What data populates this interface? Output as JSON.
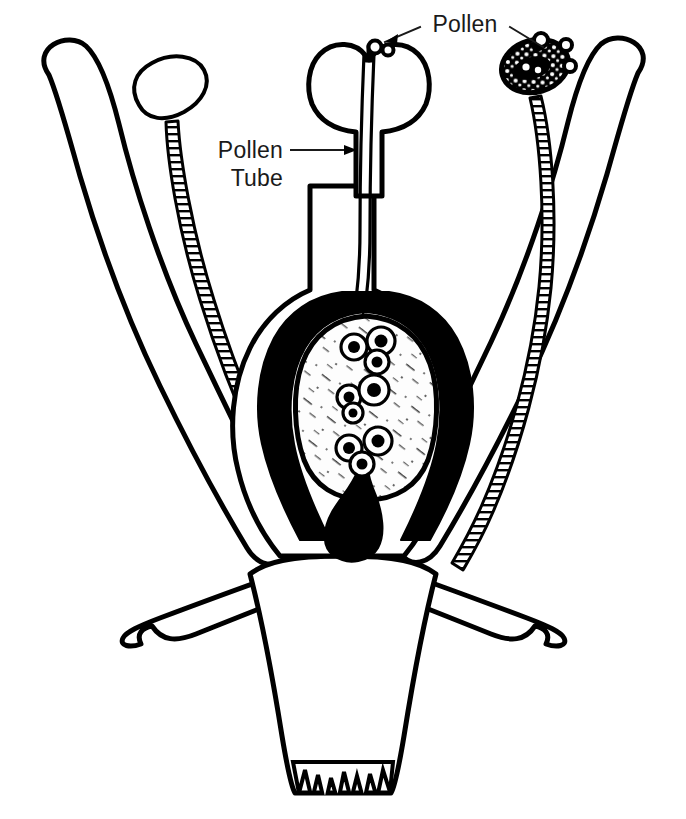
{
  "figure": {
    "background_color": "#ffffff",
    "ink_color": "#000000",
    "style": "black-and-white stippled line drawing",
    "width": 686,
    "height": 819
  },
  "labels": [
    {
      "id": "pollen",
      "text": "Pollen",
      "x": 465,
      "y": 32,
      "anchor": "middle",
      "leaders": 2
    },
    {
      "id": "pollen-tube-line1",
      "text": "Pollen",
      "x": 283,
      "y": 158,
      "anchor": "end",
      "leaders": 1
    },
    {
      "id": "pollen-tube-line2",
      "text": "Tube",
      "x": 283,
      "y": 186,
      "anchor": "end",
      "leaders": 0
    }
  ],
  "parts": [
    {
      "name": "petal-left",
      "role": "perianth lobe, stippled, curving up-left"
    },
    {
      "name": "petal-right",
      "role": "perianth lobe, stippled, curving up-right"
    },
    {
      "name": "stamen-left",
      "role": "slender filament with elongate stippled anther"
    },
    {
      "name": "stamen-right",
      "role": "slender filament with round anther shedding pollen"
    },
    {
      "name": "pistil",
      "role": "central carpel: stigma, style, ovary"
    },
    {
      "name": "stigma",
      "role": "two-lobed receptive tip with pollen grains lodged in cleft"
    },
    {
      "name": "style",
      "role": "stippled column traversed by two pollen tubes"
    },
    {
      "name": "pollen-tube",
      "role": "pair of fine tubes running from stigma to ovule"
    },
    {
      "name": "ovary-wall",
      "role": "stippled ovary enclosing a black integument layer"
    },
    {
      "name": "integument",
      "role": "solid black layer surrounding the embryo sac"
    },
    {
      "name": "embryo-sac",
      "role": "pale ovule interior holding three nuclear groups"
    },
    {
      "name": "funiculus",
      "role": "black stalk attaching ovule to ovary base"
    },
    {
      "name": "sepal-left",
      "role": "lower bract with notched tip"
    },
    {
      "name": "sepal-right",
      "role": "lower bract with notched tip"
    },
    {
      "name": "receptacle",
      "role": "heavily stippled base, torn jagged bottom edge"
    }
  ],
  "nuclei_groups": [
    {
      "id": "upper",
      "cells": 3,
      "x": 370,
      "y": 348
    },
    {
      "id": "middle",
      "cells": 3,
      "x": 366,
      "y": 393
    },
    {
      "id": "lower",
      "cells": 3,
      "x": 366,
      "y": 447
    }
  ],
  "pollen_grains": [
    {
      "id": "stigma-grain-a",
      "x": 380,
      "y": 49
    },
    {
      "id": "stigma-grain-b",
      "x": 392,
      "y": 48
    },
    {
      "id": "anther-grain-a",
      "x": 538,
      "y": 47
    },
    {
      "id": "anther-grain-b",
      "x": 555,
      "y": 44
    },
    {
      "id": "anther-grain-c",
      "x": 563,
      "y": 60
    },
    {
      "id": "anther-grain-d",
      "x": 561,
      "y": 78
    }
  ]
}
